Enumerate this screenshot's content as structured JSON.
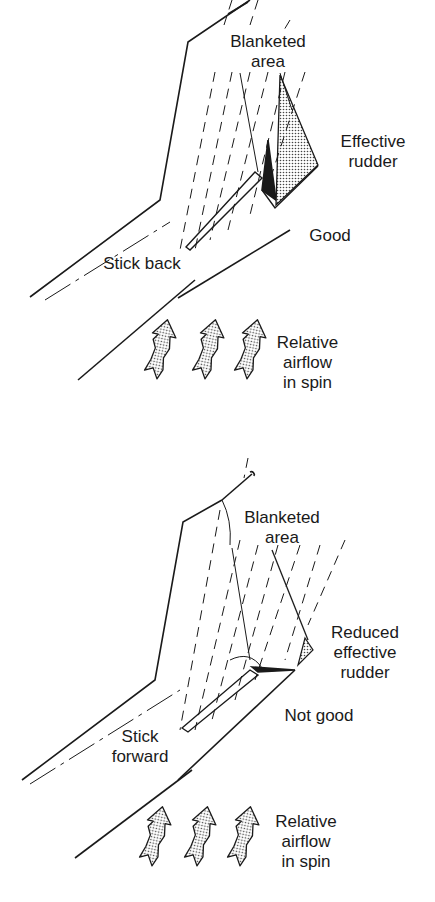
{
  "colors": {
    "ink": "#1a1a1a",
    "background": "#ffffff",
    "stipple": "#555555"
  },
  "panels": [
    {
      "id": "stick-back",
      "labels": {
        "blanketed": [
          "Blanketed",
          "area"
        ],
        "rudder": [
          "Effective",
          "rudder"
        ],
        "verdict": "Good",
        "stick": [
          "Stick back"
        ],
        "airflow": [
          "Relative",
          "airflow",
          "in spin"
        ]
      }
    },
    {
      "id": "stick-forward",
      "labels": {
        "blanketed": [
          "Blanketed",
          "area"
        ],
        "rudder": [
          "Reduced",
          "effective",
          "rudder"
        ],
        "verdict": "Not good",
        "stick": [
          "Stick",
          "forward"
        ],
        "airflow": [
          "Relative",
          "airflow",
          "in spin"
        ]
      }
    }
  ],
  "icons": {
    "airflow_arrow_count": 3
  }
}
